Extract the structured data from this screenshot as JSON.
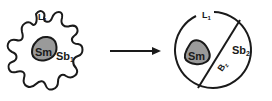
{
  "diagram": {
    "left_cell": {
      "outline_label": "L",
      "outline_label_sub": "1",
      "nucleus_label": "Sm",
      "region_label": "Sb",
      "region_label_sub": "1"
    },
    "arrow": {
      "direction": "right"
    },
    "right_cell": {
      "outline_label": "L",
      "outline_label_sub": "1",
      "nucleus_label": "Sm",
      "region_label": "Sb",
      "region_label_sub": "2",
      "boundary_label": "B",
      "boundary_label_sub": "z"
    },
    "colors": {
      "stroke": "#1a1a1a",
      "nucleus_fill": "#9a9a9a",
      "background": "#ffffff"
    }
  }
}
